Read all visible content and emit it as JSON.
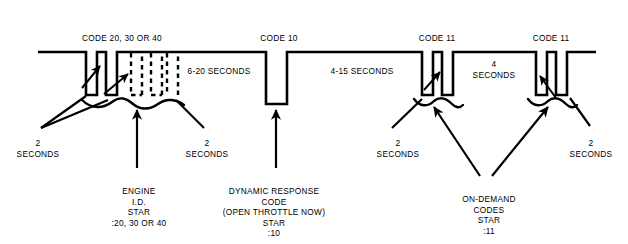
{
  "diagram": {
    "kind": "timing-waveform",
    "title_visible": false,
    "background_color": "#ffffff",
    "line_color": "#000000",
    "baseline_y": 52,
    "baseline_x_start": 38,
    "baseline_x_end": 596,
    "top_labels": [
      {
        "id": "code-20-30-40",
        "text": "CODE 20, 30 OR 40",
        "x": 122,
        "y": 33
      },
      {
        "id": "code-10",
        "text": "CODE 10",
        "x": 279,
        "y": 33
      },
      {
        "id": "code-11-first",
        "text": "CODE 11",
        "x": 437,
        "y": 33
      },
      {
        "id": "code-11-second",
        "text": "CODE 11",
        "x": 551,
        "y": 33
      }
    ],
    "interval_labels": [
      {
        "id": "interval-6-20-seconds",
        "text": "6-20 SECONDS",
        "x": 219,
        "y": 66
      },
      {
        "id": "interval-4-15-seconds",
        "text": "4-15 SECONDS",
        "x": 362,
        "y": 66
      },
      {
        "id": "interval-4-seconds",
        "line1": "4",
        "line2": "SECONDS",
        "x": 494,
        "y": 59
      }
    ],
    "duration_labels": [
      {
        "id": "duration-2-seconds-left",
        "line1": "2",
        "line2": "SECONDS",
        "x": 38,
        "y": 138
      },
      {
        "id": "duration-2-seconds-mid",
        "line1": "2",
        "line2": "SECONDS",
        "x": 207,
        "y": 138
      },
      {
        "id": "duration-2-seconds-right-inner",
        "line1": "2",
        "line2": "SECONDS",
        "x": 398,
        "y": 138
      },
      {
        "id": "duration-2-seconds-right-outer",
        "line1": "2",
        "line2": "SECONDS",
        "x": 591,
        "y": 138
      }
    ],
    "captions": [
      {
        "id": "engine-id-star-caption",
        "x": 139,
        "y": 186,
        "lines": [
          "ENGINE",
          "I.D.",
          "STAR",
          ":20, 30 OR 40"
        ]
      },
      {
        "id": "dynamic-response-caption",
        "x": 274,
        "y": 186,
        "lines": [
          "DYNAMIC RESPONSE",
          "CODE",
          "(OPEN THROTTLE NOW)",
          "STAR",
          ":10"
        ]
      },
      {
        "id": "on-demand-codes-caption",
        "x": 489,
        "y": 194,
        "lines": [
          "ON-DEMAND",
          "CODES",
          "STAR",
          ":11"
        ]
      }
    ],
    "pulse_groups": [
      {
        "id": "group-code-20-30-40",
        "label": "CODE 20, 30 OR 40",
        "pulses": [
          {
            "x1": 86,
            "x2": 97,
            "style": "solid",
            "depth": 43
          },
          {
            "x1": 106,
            "x2": 117,
            "style": "solid",
            "depth": 43
          },
          {
            "x1": 131,
            "x2": 142,
            "style": "dashed",
            "depth": 43
          },
          {
            "x1": 151,
            "x2": 162,
            "style": "dashed",
            "depth": 43
          },
          {
            "x1": 167,
            "x2": 178,
            "style": "dashed",
            "depth": 43
          }
        ],
        "brace": {
          "x1": 82,
          "x2": 184,
          "y": 104
        }
      },
      {
        "id": "group-code-10",
        "label": "CODE 10",
        "pulses": [
          {
            "x1": 266,
            "x2": 287,
            "style": "solid",
            "depth": 52
          }
        ],
        "brace": null
      },
      {
        "id": "group-code-11-first",
        "label": "CODE 11",
        "pulses": [
          {
            "x1": 422,
            "x2": 433,
            "style": "solid",
            "depth": 43
          },
          {
            "x1": 442,
            "x2": 453,
            "style": "solid",
            "depth": 43
          }
        ],
        "brace": {
          "x1": 418,
          "x2": 458,
          "y": 97
        }
      },
      {
        "id": "group-code-11-second",
        "label": "CODE 11",
        "pulses": [
          {
            "x1": 536,
            "x2": 547,
            "style": "solid",
            "depth": 43
          },
          {
            "x1": 556,
            "x2": 567,
            "style": "solid",
            "depth": 43
          }
        ],
        "brace": {
          "x1": 532,
          "x2": 572,
          "y": 97
        }
      }
    ]
  }
}
